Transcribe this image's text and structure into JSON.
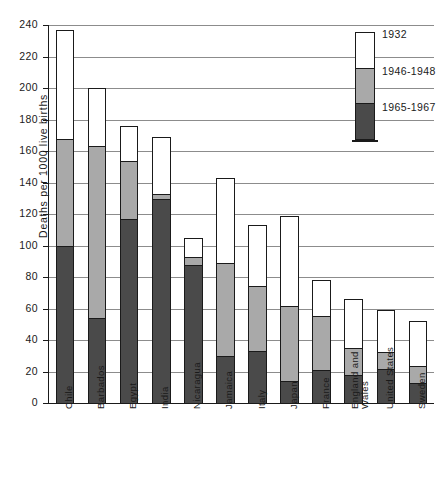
{
  "chart_data": {
    "type": "bar",
    "subtype": "stacked-vertical",
    "title": "",
    "xlabel": "",
    "ylabel": "Deaths per 1000 live births",
    "ylim": [
      0,
      240
    ],
    "ytick_step": 20,
    "yticks": [
      240,
      220,
      200,
      180,
      160,
      140,
      120,
      100,
      80,
      60,
      40,
      20,
      0
    ],
    "grid": "horizontal",
    "legend_position": "top-right",
    "categories": [
      "Chile",
      "Barbados",
      "Egypt",
      "India",
      "Nicaragua",
      "Jamaica",
      "Italy",
      "Japan",
      "France",
      "England and Wales",
      "United States",
      "Sweden"
    ],
    "series": [
      {
        "name": "1965-1967",
        "color": "#4a4a4a",
        "stack_order": 0,
        "values": [
          100,
          54,
          117,
          130,
          88,
          30,
          33,
          14,
          21,
          18,
          22,
          13
        ]
      },
      {
        "name": "1946-1948",
        "color": "#a9a9a9",
        "stack_order": 1,
        "values": [
          68,
          110,
          37,
          3,
          5,
          59,
          42,
          48,
          35,
          17,
          11,
          11
        ]
      },
      {
        "name": "1932",
        "color": "#ffffff",
        "stack_order": 2,
        "values": [
          69,
          36,
          22,
          36,
          12,
          54,
          38,
          57,
          22,
          31,
          26,
          28
        ]
      }
    ],
    "cumulative_tops": {
      "1965-1967": [
        100,
        54,
        117,
        130,
        88,
        30,
        33,
        14,
        21,
        18,
        22,
        13
      ],
      "1946-1948": [
        168,
        164,
        154,
        133,
        93,
        89,
        75,
        62,
        56,
        35,
        33,
        24
      ],
      "1932": [
        237,
        200,
        176,
        169,
        105,
        143,
        113,
        119,
        78,
        66,
        59,
        52
      ]
    }
  },
  "legend": {
    "entries": [
      {
        "label": "1932",
        "color": "#ffffff"
      },
      {
        "label": "1946-1948",
        "color": "#a9a9a9"
      },
      {
        "label": "1965-1967",
        "color": "#4a4a4a"
      }
    ]
  },
  "colors": {
    "axis": "#1a1a1a",
    "gridline": "#8c8c8c",
    "background": "#ffffff"
  }
}
